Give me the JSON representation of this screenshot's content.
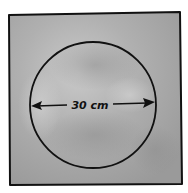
{
  "diagram": {
    "shape_outer": "square",
    "shape_inner": "circle",
    "dimension_label": "30 cm",
    "dimension_type": "diameter",
    "colors": {
      "fill": "#a9a9a9",
      "fill_light": "#c4c4c4",
      "fill_dark": "#8e8e8e",
      "stroke": "#111111",
      "background": "#ffffff"
    }
  }
}
